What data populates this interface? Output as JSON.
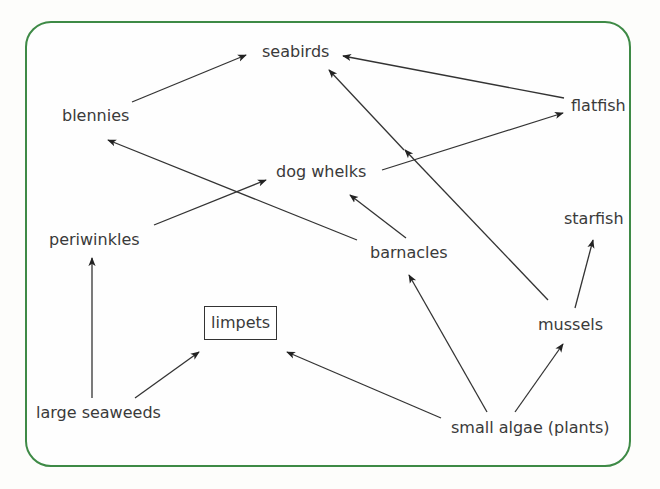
{
  "diagram": {
    "type": "food-web",
    "frame_color": "#3e8a46",
    "nodes": {
      "seabirds": "seabirds",
      "blennies": "blennies",
      "flatfish": "flatfish",
      "dog_whelks": "dog whelks",
      "periwinkles": "periwinkles",
      "barnacles": "barnacles",
      "starfish": "starfish",
      "limpets": "limpets",
      "mussels": "mussels",
      "large_seaweeds": "large seaweeds",
      "small_algae": "small algae (plants)"
    },
    "highlighted_node": "limpets",
    "edges": [
      {
        "from": "blennies",
        "to": "seabirds"
      },
      {
        "from": "flatfish",
        "to": "seabirds"
      },
      {
        "from": "mussels",
        "to": "seabirds"
      },
      {
        "from": "dog whelks",
        "to": "flatfish"
      },
      {
        "from": "barnacles",
        "to": "blennies"
      },
      {
        "from": "periwinkles",
        "to": "dog whelks"
      },
      {
        "from": "barnacles",
        "to": "dog whelks"
      },
      {
        "from": "large seaweeds",
        "to": "periwinkles"
      },
      {
        "from": "large seaweeds",
        "to": "limpets"
      },
      {
        "from": "small algae (plants)",
        "to": "limpets"
      },
      {
        "from": "small algae (plants)",
        "to": "barnacles"
      },
      {
        "from": "small algae (plants)",
        "to": "mussels"
      },
      {
        "from": "mussels",
        "to": "starfish"
      }
    ]
  }
}
